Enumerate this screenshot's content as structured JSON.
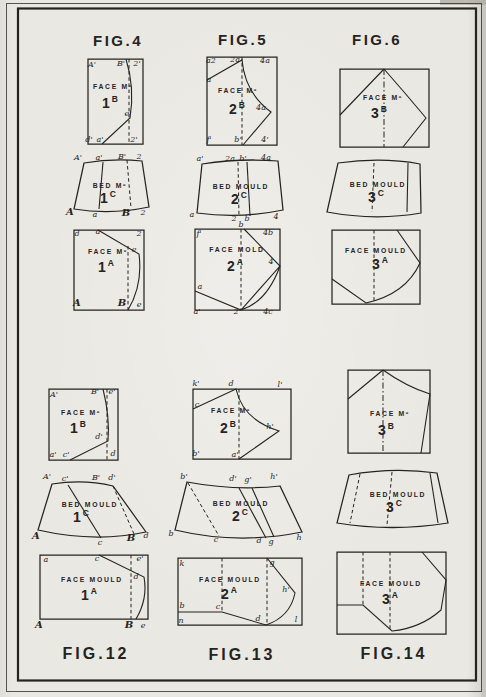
{
  "palette": {
    "paper": "#eae8e2",
    "ink": "#26231f"
  },
  "figures": [
    {
      "label": "FIG.4",
      "label_position": "top",
      "diagrams": [
        {
          "title": "FACE Mº",
          "num": "1",
          "letter": "B",
          "points": [
            {
              "t": "A'",
              "x": 92,
              "y": 67
            },
            {
              "t": "B'",
              "x": 121,
              "y": 66
            },
            {
              "t": "2'",
              "x": 137,
              "y": 66
            },
            {
              "t": "e'",
              "x": 128,
              "y": 116
            },
            {
              "t": "d'",
              "x": 89,
              "y": 142
            },
            {
              "t": "a'",
              "x": 100,
              "y": 142
            },
            {
              "t": "2'",
              "x": 134,
              "y": 142
            }
          ]
        },
        {
          "title": "BED Mº",
          "num": "1",
          "letter": "C",
          "points": [
            {
              "t": "A'",
              "x": 78,
              "y": 160
            },
            {
              "t": "a'",
              "x": 99,
              "y": 160
            },
            {
              "t": "B'",
              "x": 122,
              "y": 159
            },
            {
              "t": "2",
              "x": 139,
              "y": 159
            },
            {
              "t": "A",
              "x": 70,
              "y": 215,
              "big": true
            },
            {
              "t": "a",
              "x": 95,
              "y": 217
            },
            {
              "t": "B",
              "x": 126,
              "y": 216,
              "big": true
            },
            {
              "t": "2",
              "x": 143,
              "y": 215
            }
          ]
        },
        {
          "title": "FACE Mº",
          "num": "1",
          "letter": "A",
          "points": [
            {
              "t": "d",
              "x": 77,
              "y": 236
            },
            {
              "t": "a",
              "x": 98,
              "y": 234
            },
            {
              "t": "2",
              "x": 139,
              "y": 236
            },
            {
              "t": "e",
              "x": 134,
              "y": 252
            },
            {
              "t": "A",
              "x": 77,
              "y": 306,
              "big": true
            },
            {
              "t": "B",
              "x": 122,
              "y": 306,
              "big": true
            },
            {
              "t": "e",
              "x": 139,
              "y": 307
            }
          ]
        }
      ]
    },
    {
      "label": "FIG.5",
      "label_position": "top",
      "diagrams": [
        {
          "title": "FACE Mº",
          "num": "2",
          "letter": "B",
          "points": [
            {
              "t": "a2",
              "x": 211,
              "y": 63
            },
            {
              "t": "2a",
              "x": 235,
              "y": 62
            },
            {
              "t": "4a",
              "x": 265,
              "y": 63
            },
            {
              "t": "a",
              "x": 209,
              "y": 82
            },
            {
              "t": "4a",
              "x": 261,
              "y": 110
            },
            {
              "t": "f'",
              "x": 209,
              "y": 142
            },
            {
              "t": "b'",
              "x": 238,
              "y": 142
            },
            {
              "t": "4'",
              "x": 265,
              "y": 142
            }
          ]
        },
        {
          "title": "BED MOULD",
          "num": "2",
          "letter": "C",
          "points": [
            {
              "t": "a'",
              "x": 200,
              "y": 161
            },
            {
              "t": "2a",
              "x": 230,
              "y": 161
            },
            {
              "t": "b'",
              "x": 243,
              "y": 161
            },
            {
              "t": "4a",
              "x": 266,
              "y": 160
            },
            {
              "t": "a",
              "x": 192,
              "y": 217
            },
            {
              "t": "2",
              "x": 234,
              "y": 221
            },
            {
              "t": "b",
              "x": 247,
              "y": 221
            },
            {
              "t": "4",
              "x": 276,
              "y": 219
            }
          ]
        },
        {
          "title": "FACE MOLD",
          "num": "2",
          "letter": "A",
          "points": [
            {
              "t": "f'",
              "x": 199,
              "y": 236
            },
            {
              "t": "b",
              "x": 241,
              "y": 227
            },
            {
              "t": "4b",
              "x": 268,
              "y": 235
            },
            {
              "t": "4",
              "x": 271,
              "y": 264
            },
            {
              "t": "a",
              "x": 200,
              "y": 289
            },
            {
              "t": "a'",
              "x": 197,
              "y": 314
            },
            {
              "t": "2",
              "x": 236,
              "y": 314
            },
            {
              "t": "4c",
              "x": 268,
              "y": 314
            }
          ]
        }
      ]
    },
    {
      "label": "FIG.6",
      "label_position": "top",
      "diagrams": [
        {
          "title": "FACE Mº",
          "num": "3",
          "letter": "B",
          "points": []
        },
        {
          "title": "BED MOULD",
          "num": "3",
          "letter": "C",
          "points": []
        },
        {
          "title": "FACE MOULD",
          "num": "3",
          "letter": "A",
          "points": []
        }
      ]
    },
    {
      "label": "FIG.12",
      "label_position": "bottom",
      "diagrams": [
        {
          "title": "FACE Mº",
          "num": "1",
          "letter": "B",
          "points": [
            {
              "t": "A'",
              "x": 54,
              "y": 397
            },
            {
              "t": "B'",
              "x": 95,
              "y": 394
            },
            {
              "t": "e'",
              "x": 112,
              "y": 394
            },
            {
              "t": "d'",
              "x": 99,
              "y": 439
            },
            {
              "t": "a'",
              "x": 53,
              "y": 457
            },
            {
              "t": "c'",
              "x": 66,
              "y": 457
            },
            {
              "t": "d",
              "x": 113,
              "y": 456
            }
          ]
        },
        {
          "title": "BED MOULD",
          "num": "1",
          "letter": "C",
          "points": [
            {
              "t": "A'",
              "x": 47,
              "y": 479
            },
            {
              "t": "c'",
              "x": 65,
              "y": 481
            },
            {
              "t": "B'",
              "x": 96,
              "y": 480
            },
            {
              "t": "d'",
              "x": 112,
              "y": 480
            },
            {
              "t": "A",
              "x": 36,
              "y": 539,
              "big": true
            },
            {
              "t": "c",
              "x": 100,
              "y": 545
            },
            {
              "t": "B",
              "x": 131,
              "y": 541,
              "big": true
            },
            {
              "t": "d",
              "x": 146,
              "y": 538
            }
          ]
        },
        {
          "title": "FACE MOULD",
          "num": "1",
          "letter": "A",
          "points": [
            {
              "t": "a",
              "x": 46,
              "y": 562
            },
            {
              "t": "c",
              "x": 97,
              "y": 561
            },
            {
              "t": "e'",
              "x": 140,
              "y": 561
            },
            {
              "t": "d",
              "x": 136,
              "y": 579
            },
            {
              "t": "A",
              "x": 39,
              "y": 628,
              "big": true
            },
            {
              "t": "B",
              "x": 129,
              "y": 628,
              "big": true
            },
            {
              "t": "e",
              "x": 143,
              "y": 628
            }
          ]
        }
      ]
    },
    {
      "label": "FIG.13",
      "label_position": "bottom",
      "diagrams": [
        {
          "title": "FACE Mº",
          "num": "2",
          "letter": "B",
          "points": [
            {
              "t": "k'",
              "x": 196,
              "y": 386
            },
            {
              "t": "d",
              "x": 231,
              "y": 386
            },
            {
              "t": "l'",
              "x": 280,
              "y": 387
            },
            {
              "t": "c",
              "x": 197,
              "y": 407
            },
            {
              "t": "h'",
              "x": 270,
              "y": 429
            },
            {
              "t": "b'",
              "x": 196,
              "y": 456
            },
            {
              "t": "a'",
              "x": 235,
              "y": 457
            }
          ]
        },
        {
          "title": "BED MOULD",
          "num": "2",
          "letter": "C",
          "points": [
            {
              "t": "b'",
              "x": 184,
              "y": 479
            },
            {
              "t": "d'",
              "x": 233,
              "y": 481
            },
            {
              "t": "g'",
              "x": 248,
              "y": 482
            },
            {
              "t": "h'",
              "x": 274,
              "y": 479
            },
            {
              "t": "b",
              "x": 171,
              "y": 536
            },
            {
              "t": "c",
              "x": 216,
              "y": 542
            },
            {
              "t": "d",
              "x": 259,
              "y": 543
            },
            {
              "t": "g",
              "x": 271,
              "y": 544
            },
            {
              "t": "h",
              "x": 299,
              "y": 540
            }
          ]
        },
        {
          "title": "FACE MOULD",
          "num": "2",
          "letter": "A",
          "points": [
            {
              "t": "k",
              "x": 182,
              "y": 566
            },
            {
              "t": "g",
              "x": 272,
              "y": 565
            },
            {
              "t": "h'",
              "x": 286,
              "y": 592
            },
            {
              "t": "b",
              "x": 182,
              "y": 608
            },
            {
              "t": "c",
              "x": 218,
              "y": 609
            },
            {
              "t": "d",
              "x": 258,
              "y": 621
            },
            {
              "t": "n",
              "x": 181,
              "y": 623
            },
            {
              "t": "l",
              "x": 296,
              "y": 622
            }
          ]
        }
      ]
    },
    {
      "label": "FIG.14",
      "label_position": "bottom",
      "diagrams": [
        {
          "title": "FACE Mº",
          "num": "3",
          "letter": "B",
          "points": []
        },
        {
          "title": "BED MOULD",
          "num": "3",
          "letter": "C",
          "points": []
        },
        {
          "title": "FACE MOULD",
          "num": "3",
          "letter": "A",
          "points": []
        }
      ]
    }
  ]
}
